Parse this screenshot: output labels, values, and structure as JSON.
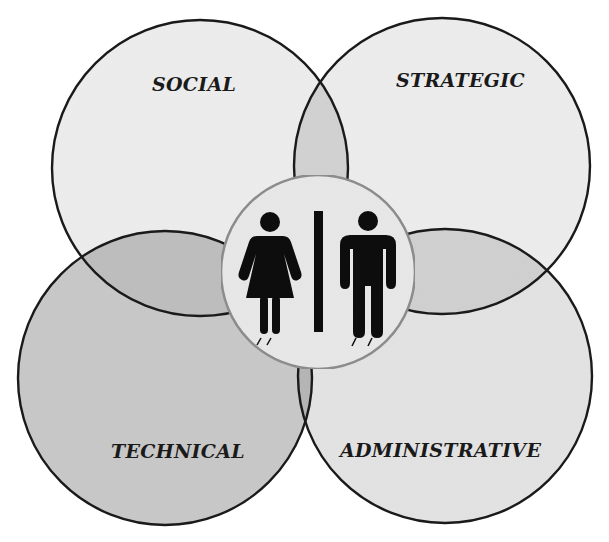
{
  "diagram": {
    "type": "venn",
    "circles": [
      {
        "id": "social",
        "label": "SOCIAL",
        "position": "top-left",
        "fill": "#ededed"
      },
      {
        "id": "strategic",
        "label": "STRATEGIC",
        "position": "top-right",
        "fill": "#ededed"
      },
      {
        "id": "technical",
        "label": "TECHNICAL",
        "position": "bottom-left",
        "fill": "#c8c8c8"
      },
      {
        "id": "administrative",
        "label": "ADMINISTRATIVE",
        "position": "bottom-right",
        "fill": "#e3e3e3"
      }
    ],
    "center": {
      "icon": "woman-man-icon",
      "fill": "#e8e8e8",
      "stroke": "#8a8a8a"
    },
    "colors": {
      "outline": "#1a1a1a",
      "overlap_top": "#d2d2d2",
      "overlap_left": "#bdbdbd",
      "overlap_right": "#d0d0d0",
      "overlap_bottom": "#b5b5b5",
      "figure": "#0d0d0d",
      "background": "#ffffff"
    }
  }
}
